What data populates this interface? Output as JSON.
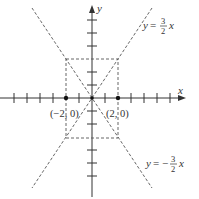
{
  "figure": {
    "axes": {
      "x_label": "x",
      "y_label": "y"
    },
    "points": [
      {
        "label": "(−2, 0)",
        "x": -2,
        "y": 0
      },
      {
        "label": "(2, 0)",
        "x": 2,
        "y": 0
      }
    ],
    "asymptotes": [
      {
        "label_lhs": "y = ",
        "label_num": "3",
        "label_den": "2",
        "label_var": "x",
        "sign": "",
        "slope": 1.5
      },
      {
        "label_lhs": "y = −",
        "label_num": "3",
        "label_den": "2",
        "label_var": "x",
        "sign": "−",
        "slope": -1.5
      }
    ],
    "rectangle": {
      "x_min": -2,
      "x_max": 2,
      "y_min": -3,
      "y_max": 3
    },
    "colors": {
      "line": "#333333",
      "dashed": "#555555",
      "background": "#ffffff"
    }
  }
}
